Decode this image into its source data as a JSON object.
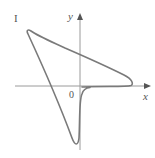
{
  "figure": {
    "panel_label": "I",
    "axes": {
      "x_label": "x",
      "y_label": "y",
      "origin_label": "0"
    },
    "colors": {
      "curve": "#7a7a7a",
      "axes": "#9a9a9a",
      "text": "#555555",
      "background": "#ffffff"
    }
  }
}
